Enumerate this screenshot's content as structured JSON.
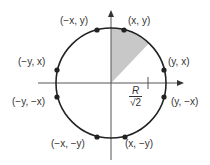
{
  "diagram": {
    "circle": {
      "center": [
        111,
        83
      ],
      "radius": 55,
      "stroke": "#222222"
    },
    "shaded_octant": {
      "fill": "#c8c8c8"
    },
    "axes": {
      "color": "#555555"
    },
    "points": [
      {
        "label": "(x, y)",
        "pos": [
          124,
          29
        ]
      },
      {
        "label": "(y, x)",
        "pos": [
          164,
          70
        ]
      },
      {
        "label": "(y, −x)",
        "pos": [
          164,
          97
        ]
      },
      {
        "label": "(x, −y)",
        "pos": [
          124,
          137
        ]
      },
      {
        "label": "(−x, −y)",
        "pos": [
          98,
          137
        ]
      },
      {
        "label": "(−y, −x)",
        "pos": [
          58,
          97
        ]
      },
      {
        "label": "(−y, x)",
        "pos": [
          58,
          70
        ]
      },
      {
        "label": "(−x, y)",
        "pos": [
          98,
          29
        ]
      }
    ],
    "annotation": {
      "numerator": "R",
      "denominator": "√2"
    }
  }
}
